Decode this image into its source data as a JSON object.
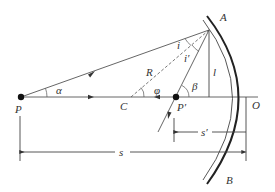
{
  "diagram": {
    "labels": {
      "P": "P",
      "P_image": "P′",
      "C": "C",
      "O": "O",
      "A": "A",
      "B": "B",
      "R": "R",
      "l": "l",
      "alpha": "α",
      "beta": "β",
      "phi": "φ",
      "i_incident": "i",
      "i_reflected": "i′",
      "s": "s",
      "s_prime": "s′"
    },
    "colors": {
      "line": "#555555",
      "mirror": "#222222",
      "text": "#333333",
      "background": "#ffffff"
    }
  }
}
